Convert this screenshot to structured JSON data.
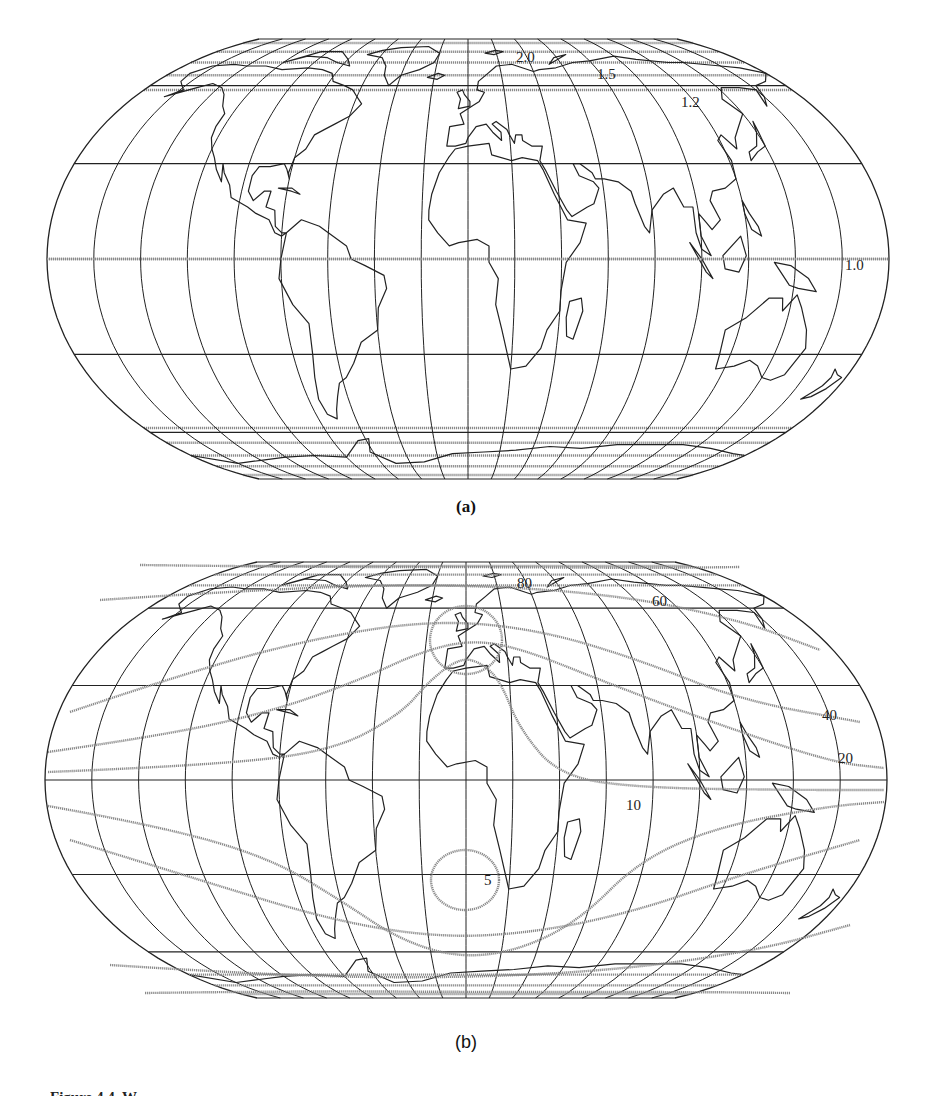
{
  "figure": {
    "panels": [
      {
        "id": "a",
        "panel_label": "(a)",
        "description": "Wagner-type world projection with scale-factor contours along parallels",
        "contour_labels": [
          "2.0",
          "1.5",
          "1.2",
          "1.0"
        ]
      },
      {
        "id": "b",
        "panel_label": "(b)",
        "description": "Same projection with isolines of angular distortion",
        "contour_labels": [
          "80",
          "60",
          "40",
          "20",
          "10",
          "5"
        ]
      }
    ],
    "caption_fragment": "Figure 4.4. W..."
  },
  "colors": {
    "line": "#222222",
    "contour": "#8a8a8a",
    "background": "#ffffff"
  }
}
